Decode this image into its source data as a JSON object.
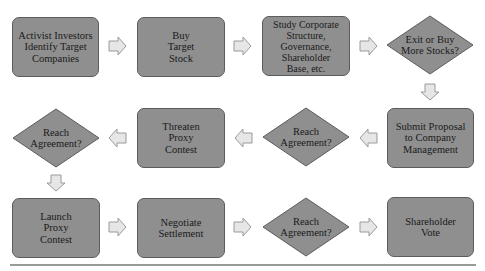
{
  "colors": {
    "shape_fill": "#8f8f8f",
    "shape_border": "#5c5c5c",
    "arrow_fill": "#e6e6e6",
    "arrow_border": "#9a9a9a"
  },
  "rows": [
    {
      "nodes": [
        {
          "type": "process",
          "label": "Activist Investors\nIdentify Target\nCompanies"
        },
        {
          "type": "process",
          "label": "Buy\nTarget\nStock"
        },
        {
          "type": "process",
          "label": "Study Corporate\nStructure,\nGovernance,\nShareholder\nBase, etc."
        },
        {
          "type": "decision",
          "label": "Exit or Buy\nMore Stocks?"
        }
      ]
    },
    {
      "nodes": [
        {
          "type": "decision",
          "label": "Reach\nAgreement?"
        },
        {
          "type": "process",
          "label": "Threaten\nProxy\nContest"
        },
        {
          "type": "decision",
          "label": "Reach\nAgreement?"
        },
        {
          "type": "process",
          "label": "Submit Proposal\nto Company\nManagement"
        }
      ]
    },
    {
      "nodes": [
        {
          "type": "process",
          "label": "Launch\nProxy\nContest"
        },
        {
          "type": "process",
          "label": "Negotiate\nSettlement"
        },
        {
          "type": "decision",
          "label": "Reach\nAgreement?"
        },
        {
          "type": "process",
          "label": "Shareholder\nVote"
        }
      ]
    }
  ],
  "arrows": [
    {
      "from": "Activist Investors Identify Target Companies",
      "to": "Buy Target Stock",
      "direction": "right"
    },
    {
      "from": "Buy Target Stock",
      "to": "Study Corporate Structure",
      "direction": "right"
    },
    {
      "from": "Study Corporate Structure",
      "to": "Exit or Buy More Stocks?",
      "direction": "right"
    },
    {
      "from": "Exit or Buy More Stocks?",
      "to": "Submit Proposal to Company Management",
      "direction": "down"
    },
    {
      "from": "Submit Proposal to Company Management",
      "to": "Reach Agreement? (row 2)",
      "direction": "left"
    },
    {
      "from": "Reach Agreement? (row 2)",
      "to": "Threaten Proxy Contest",
      "direction": "left"
    },
    {
      "from": "Threaten Proxy Contest",
      "to": "Reach Agreement? (row 2 left)",
      "direction": "left"
    },
    {
      "from": "Reach Agreement? (row 2 left)",
      "to": "Launch Proxy Contest",
      "direction": "down"
    },
    {
      "from": "Launch Proxy Contest",
      "to": "Negotiate Settlement",
      "direction": "right"
    },
    {
      "from": "Negotiate Settlement",
      "to": "Reach Agreement? (row 3)",
      "direction": "right"
    },
    {
      "from": "Reach Agreement? (row 3)",
      "to": "Shareholder Vote",
      "direction": "right"
    }
  ]
}
